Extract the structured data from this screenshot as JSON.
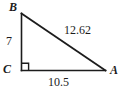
{
  "figure": {
    "type": "right-triangle-diagram",
    "background_color": "#ffffff",
    "stroke_color": "#1c1c1c",
    "text_color": "#1c1c1c"
  },
  "vertices": {
    "b": {
      "label": "B",
      "x": 21,
      "y": 13
    },
    "c": {
      "label": "C",
      "x": 21,
      "y": 70
    },
    "a": {
      "label": "A",
      "x": 105,
      "y": 70
    }
  },
  "sides": {
    "bc": {
      "label": "7",
      "name": "vertical-leg"
    },
    "ca": {
      "label": "10.5",
      "name": "horizontal-leg"
    },
    "ba": {
      "label": "12.62",
      "name": "hypotenuse"
    }
  },
  "right_angle": {
    "at_vertex": "C",
    "marker": "square",
    "size": 7
  }
}
